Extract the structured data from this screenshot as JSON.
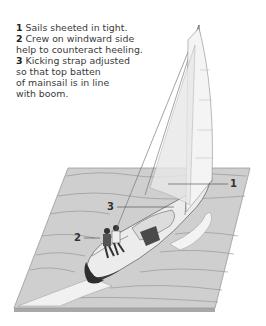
{
  "caption": {
    "items": [
      {
        "num": "1",
        "lines": [
          "Sails sheeted in tight."
        ]
      },
      {
        "num": "2",
        "lines": [
          "Crew on windward side",
          "help to counteract heeling."
        ]
      },
      {
        "num": "3",
        "lines": [
          "Kicking strap adjusted",
          "so that top batten",
          "of mainsail is in line",
          "with boom."
        ]
      }
    ]
  },
  "callouts": [
    {
      "label": "1"
    },
    {
      "label": "2"
    },
    {
      "label": "3"
    }
  ],
  "colors": {
    "water": "#cfcfcf",
    "water_edge": "#9a9a9a",
    "wake": "#f2f2f2",
    "hull_dark": "#3c3c3c",
    "deck": "#e6e6e6",
    "line": "#555555",
    "text": "#3a3a3a"
  }
}
